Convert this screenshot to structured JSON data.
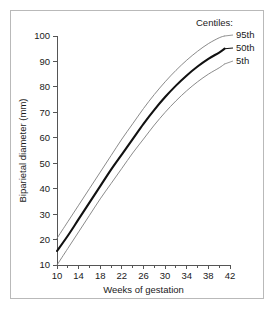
{
  "figure": {
    "background_color": "#ffffff",
    "border_color": "#b9b9b9"
  },
  "legend": {
    "title": "Centiles:",
    "entries": [
      {
        "label": "95th"
      },
      {
        "label": "50th"
      },
      {
        "label": "5th"
      }
    ]
  },
  "chart_data": {
    "type": "line",
    "title": "",
    "xlabel": "Weeks of gestation",
    "ylabel": "Biparietal diameter (mm)",
    "xlim": [
      10,
      42
    ],
    "ylim": [
      10,
      100
    ],
    "grid": false,
    "legend_position": "top-right",
    "legend_title": "Centiles:",
    "x_tick_labels": [
      "10",
      "14",
      "18",
      "22",
      "26",
      "30",
      "34",
      "38",
      "42"
    ],
    "x_major_ticks": [
      10,
      14,
      18,
      22,
      26,
      30,
      34,
      38,
      42
    ],
    "x_minor_ticks": [
      12,
      16,
      20,
      24,
      28,
      32,
      36,
      40
    ],
    "y_tick_labels": [
      "10",
      "20",
      "30",
      "40",
      "50",
      "60",
      "70",
      "80",
      "90",
      "100"
    ],
    "y_major_ticks": [
      10,
      20,
      30,
      40,
      50,
      60,
      70,
      80,
      90,
      100
    ],
    "x": [
      10,
      12,
      14,
      16,
      18,
      20,
      22,
      24,
      26,
      28,
      30,
      32,
      34,
      36,
      38,
      40,
      41
    ],
    "series": [
      {
        "name": "95th",
        "style": "thin",
        "color": "#7d7d7d",
        "values": [
          20.5,
          27.0,
          33.5,
          40.0,
          46.5,
          53.0,
          59.5,
          65.5,
          71.5,
          77.0,
          82.0,
          86.5,
          90.5,
          94.0,
          97.0,
          99.3,
          100.0
        ]
      },
      {
        "name": "50th",
        "style": "thick",
        "color": "#111111",
        "values": [
          15.5,
          21.5,
          28.0,
          34.5,
          41.0,
          47.5,
          53.5,
          59.5,
          65.5,
          71.0,
          76.0,
          80.5,
          84.5,
          88.0,
          91.0,
          93.5,
          95.0
        ]
      },
      {
        "name": "5th",
        "style": "thin",
        "color": "#7d7d7d",
        "values": [
          10.0,
          16.5,
          23.0,
          29.5,
          36.0,
          42.0,
          48.0,
          54.0,
          59.5,
          65.0,
          70.0,
          74.5,
          78.5,
          82.0,
          85.0,
          87.5,
          89.0
        ]
      }
    ]
  }
}
